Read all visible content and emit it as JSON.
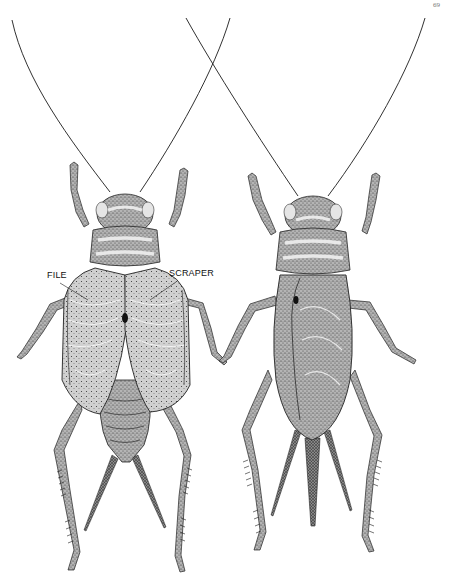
{
  "page": {
    "page_number": "69"
  },
  "figure": {
    "subjects": [
      {
        "name": "male-cricket",
        "view": "dorsal",
        "labels": [
          "FILE",
          "SCRAPER"
        ]
      },
      {
        "name": "female-cricket",
        "view": "dorsal",
        "labels": []
      }
    ],
    "labels": {
      "file": "FILE",
      "scraper": "SCRAPER"
    },
    "colors": {
      "ink": "#1a1a1a",
      "body_shade": "#8c8c8c",
      "wing_shade": "#a6a6a6",
      "highlight": "#d9d9d9",
      "paper": "#ffffff"
    }
  }
}
